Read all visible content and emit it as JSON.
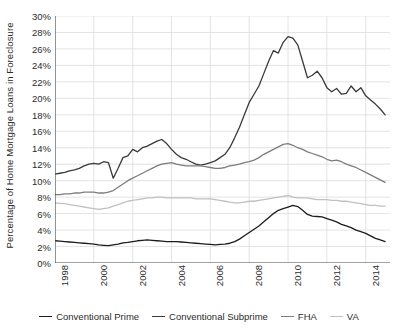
{
  "chart_data": {
    "type": "line",
    "title": "",
    "xlabel": "",
    "ylabel": "Percentage of Home Mortgage Loans in Foreclosure",
    "xlim": [
      1998,
      2015.25
    ],
    "ylim": [
      0,
      30
    ],
    "grid": true,
    "legend_position": "bottom",
    "y_tick_labels": [
      "0%",
      "2%",
      "4%",
      "6%",
      "8%",
      "10%",
      "12%",
      "14%",
      "16%",
      "18%",
      "20%",
      "22%",
      "24%",
      "26%",
      "28%",
      "30%"
    ],
    "y_tick_values": [
      0,
      2,
      4,
      6,
      8,
      10,
      12,
      14,
      16,
      18,
      20,
      22,
      24,
      26,
      28,
      30
    ],
    "x_tick_labels": [
      "1998",
      "2000",
      "2002",
      "2004",
      "2006",
      "2008",
      "2010",
      "2012",
      "2014"
    ],
    "x_tick_values": [
      1998,
      2000,
      2002,
      2004,
      2006,
      2008,
      2010,
      2012,
      2014
    ],
    "x": [
      1998,
      1998.25,
      1998.5,
      1998.75,
      1999,
      1999.25,
      1999.5,
      1999.75,
      2000,
      2000.25,
      2000.5,
      2000.75,
      2001,
      2001.25,
      2001.5,
      2001.75,
      2002,
      2002.25,
      2002.5,
      2002.75,
      2003,
      2003.25,
      2003.5,
      2003.75,
      2004,
      2004.25,
      2004.5,
      2004.75,
      2005,
      2005.25,
      2005.5,
      2005.75,
      2006,
      2006.25,
      2006.5,
      2006.75,
      2007,
      2007.25,
      2007.5,
      2007.75,
      2008,
      2008.25,
      2008.5,
      2008.75,
      2009,
      2009.25,
      2009.5,
      2009.75,
      2010,
      2010.25,
      2010.5,
      2010.75,
      2011,
      2011.25,
      2011.5,
      2011.75,
      2012,
      2012.25,
      2012.5,
      2012.75,
      2013,
      2013.25,
      2013.5,
      2013.75,
      2014,
      2014.25,
      2014.5,
      2014.75,
      2015
    ],
    "series": [
      {
        "name": "Conventional Prime",
        "color": "#1c1c1c",
        "values": [
          2.7,
          2.65,
          2.6,
          2.55,
          2.5,
          2.45,
          2.4,
          2.35,
          2.3,
          2.2,
          2.15,
          2.1,
          2.2,
          2.3,
          2.45,
          2.5,
          2.6,
          2.7,
          2.75,
          2.8,
          2.75,
          2.7,
          2.65,
          2.6,
          2.6,
          2.6,
          2.55,
          2.5,
          2.45,
          2.4,
          2.35,
          2.3,
          2.25,
          2.2,
          2.25,
          2.3,
          2.4,
          2.6,
          2.9,
          3.3,
          3.7,
          4.1,
          4.5,
          5.0,
          5.5,
          6.0,
          6.4,
          6.6,
          6.8,
          7.0,
          6.85,
          6.4,
          5.9,
          5.7,
          5.65,
          5.6,
          5.4,
          5.2,
          5.0,
          4.7,
          4.5,
          4.3,
          4.0,
          3.8,
          3.6,
          3.3,
          3.0,
          2.8,
          2.6
        ]
      },
      {
        "name": "Conventional Subprime",
        "color": "#3a3a3a",
        "values": [
          10.8,
          10.9,
          11.0,
          11.2,
          11.3,
          11.5,
          11.8,
          12.0,
          12.1,
          12.0,
          12.3,
          12.2,
          10.3,
          11.5,
          12.8,
          13.0,
          13.8,
          13.5,
          14.0,
          14.2,
          14.5,
          14.8,
          15.0,
          14.5,
          13.8,
          13.2,
          12.8,
          12.6,
          12.3,
          12.0,
          11.9,
          12.0,
          12.2,
          12.4,
          12.8,
          13.2,
          14.0,
          15.2,
          16.5,
          18.0,
          19.5,
          20.5,
          21.5,
          23.0,
          24.5,
          25.8,
          25.5,
          26.8,
          27.5,
          27.3,
          26.5,
          24.5,
          22.5,
          22.8,
          23.3,
          22.5,
          21.3,
          20.8,
          21.2,
          20.5,
          20.6,
          21.5,
          20.8,
          21.3,
          20.3,
          19.8,
          19.3,
          18.7,
          18.0
        ]
      },
      {
        "name": "FHA",
        "color": "#7d7d7d",
        "values": [
          8.3,
          8.3,
          8.4,
          8.4,
          8.5,
          8.5,
          8.6,
          8.6,
          8.6,
          8.5,
          8.5,
          8.6,
          8.8,
          9.2,
          9.6,
          10.0,
          10.3,
          10.6,
          10.9,
          11.2,
          11.5,
          11.8,
          12.0,
          12.1,
          12.2,
          12.0,
          11.9,
          11.8,
          11.8,
          11.8,
          11.8,
          11.7,
          11.6,
          11.5,
          11.5,
          11.6,
          11.8,
          11.9,
          12.0,
          12.2,
          12.3,
          12.5,
          12.8,
          13.2,
          13.5,
          13.8,
          14.1,
          14.4,
          14.5,
          14.3,
          14.0,
          13.8,
          13.5,
          13.3,
          13.1,
          12.9,
          12.6,
          12.4,
          12.5,
          12.3,
          12.0,
          11.8,
          11.6,
          11.3,
          11.0,
          10.7,
          10.4,
          10.1,
          9.8
        ]
      },
      {
        "name": "VA",
        "color": "#c0c0c0",
        "values": [
          7.3,
          7.25,
          7.2,
          7.1,
          7.0,
          6.9,
          6.8,
          6.7,
          6.6,
          6.5,
          6.6,
          6.7,
          6.9,
          7.1,
          7.3,
          7.5,
          7.6,
          7.7,
          7.8,
          7.9,
          7.9,
          8.0,
          8.0,
          7.9,
          7.9,
          7.9,
          7.9,
          7.9,
          7.9,
          7.8,
          7.8,
          7.8,
          7.8,
          7.7,
          7.6,
          7.5,
          7.4,
          7.3,
          7.3,
          7.4,
          7.5,
          7.5,
          7.6,
          7.7,
          7.8,
          7.9,
          8.0,
          8.1,
          8.2,
          8.0,
          7.9,
          7.9,
          7.9,
          7.8,
          7.7,
          7.7,
          7.7,
          7.6,
          7.6,
          7.5,
          7.5,
          7.4,
          7.3,
          7.2,
          7.1,
          7.0,
          7.0,
          6.9,
          6.9
        ]
      }
    ]
  },
  "legend": {
    "items": [
      {
        "label": "Conventional Prime",
        "color": "#1c1c1c"
      },
      {
        "label": "Conventional Subprime",
        "color": "#3a3a3a"
      },
      {
        "label": "FHA",
        "color": "#7d7d7d"
      },
      {
        "label": "VA",
        "color": "#c0c0c0"
      }
    ]
  },
  "colors": {
    "background": "#ffffff",
    "grid": "#dcdcdc",
    "axis": "#555555",
    "text": "#2b2b2b"
  }
}
